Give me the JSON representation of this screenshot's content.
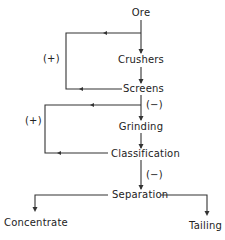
{
  "diagram": {
    "nodes": {
      "ore": "Ore",
      "crushers": "Crushers",
      "screens": "Screens",
      "grinding": "Grinding",
      "classification": "Classification",
      "separation": "Separation",
      "concentrate": "Concentrate",
      "tailing": "Tailing"
    },
    "labels": {
      "crusher_loop_sign": "(+)",
      "screens_to_grinding_sign": "(−)",
      "grinding_loop_sign": "(+)",
      "classification_to_separation_sign": "(−)"
    },
    "edges": [
      {
        "from": "Ore",
        "to": "Crushers"
      },
      {
        "from": "Crushers",
        "to": "Screens"
      },
      {
        "from": "Screens",
        "to": "Crushers",
        "label": "(+)",
        "type": "recycle"
      },
      {
        "from": "Screens",
        "to": "Grinding",
        "label": "(−)"
      },
      {
        "from": "Grinding",
        "to": "Classification"
      },
      {
        "from": "Classification",
        "to": "Grinding",
        "label": "(+)",
        "type": "recycle"
      },
      {
        "from": "Classification",
        "to": "Separation",
        "label": "(−)"
      },
      {
        "from": "Separation",
        "to": "Concentrate"
      },
      {
        "from": "Separation",
        "to": "Tailing"
      }
    ]
  }
}
